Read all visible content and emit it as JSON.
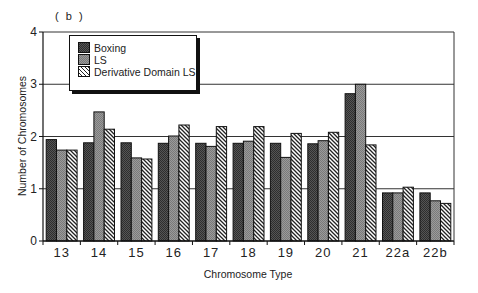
{
  "chart_data": {
    "type": "bar",
    "panel_label": "( b )",
    "title": "",
    "xlabel": "Chromosome Type",
    "ylabel": "Number of Chromosomes",
    "ylim": [
      0,
      4
    ],
    "yticks": [
      "0",
      "1",
      "2",
      "3",
      "4"
    ],
    "grid": "horizontal",
    "legend_position": "upper-left",
    "categories": [
      "13",
      "14",
      "15",
      "16",
      "17",
      "18",
      "19",
      "20",
      "21",
      "22a",
      "22b"
    ],
    "series": [
      {
        "name": "Boxing",
        "style": "dark-gray-fill",
        "color": "#4a4a4a",
        "values": [
          1.94,
          1.88,
          1.88,
          1.87,
          1.87,
          1.87,
          1.87,
          1.86,
          2.82,
          0.92,
          0.92
        ]
      },
      {
        "name": "LS",
        "style": "medium-gray-fill",
        "color": "#8c8c8c",
        "values": [
          1.74,
          2.47,
          1.59,
          2.01,
          1.81,
          1.91,
          1.6,
          1.92,
          3.0,
          0.92,
          0.77
        ]
      },
      {
        "name": "Derivative Domain LS",
        "style": "diagonal-hatch",
        "color": "#ffffff",
        "values": [
          1.74,
          2.14,
          1.57,
          2.22,
          2.19,
          2.19,
          2.06,
          2.08,
          1.84,
          1.03,
          0.72
        ]
      }
    ]
  }
}
